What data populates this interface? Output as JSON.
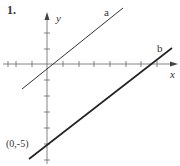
{
  "problem_number": "1.",
  "axes": {
    "x_label": "x",
    "y_label": "y",
    "origin_px": [
      47,
      64
    ],
    "tick_spacing_px": 15.7,
    "x_ticks_px": [
      8,
      16,
      32,
      63,
      79,
      94,
      110,
      126,
      141,
      157
    ],
    "y_ticks_px": [
      33,
      49,
      80,
      96,
      112,
      128,
      144,
      160
    ]
  },
  "lines": [
    {
      "name": "a",
      "label": "a",
      "x1": 22,
      "y1": 89,
      "x2": 123,
      "y2": 8,
      "label_pos": [
        104,
        16
      ],
      "stroke_width": 1
    },
    {
      "name": "b",
      "label": "b",
      "x1": 29,
      "y1": 159,
      "x2": 172,
      "y2": 48,
      "label_pos": [
        157,
        52
      ],
      "stroke_width": 1.6
    }
  ],
  "annotations": [
    {
      "text": "(0,-5)",
      "x": 6,
      "y": 147
    }
  ],
  "colors": {
    "ink": "#333333",
    "axis": "#555555"
  }
}
